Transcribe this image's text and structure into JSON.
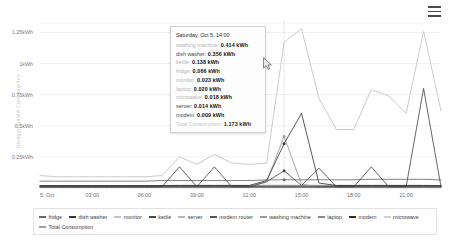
{
  "header": {
    "menu_icon": "hamburger-menu-icon"
  },
  "cursor": {
    "icon": "mouse-pointer-icon",
    "x": 263,
    "y": 57
  },
  "axis": {
    "y_title": "Disaggregated Consumption",
    "y_ticks": [
      "1.25kWh",
      "1kWh",
      "0.75kWh",
      "0.5kWh",
      "0.25kWh"
    ],
    "x_ticks": [
      "5. Oct",
      "03:00",
      "06:00",
      "09:00",
      "12:00",
      "15:00",
      "18:00",
      "21:00"
    ]
  },
  "tooltip": {
    "title": "Saturday, Oct 5, 14:00",
    "rows": [
      {
        "label": "washing machine:",
        "value": "0.414 kWh",
        "dim": true
      },
      {
        "label": "dish washer:",
        "value": "0.356 kWh",
        "dim": false
      },
      {
        "label": "kettle:",
        "value": "0.138 kWh",
        "dim": true
      },
      {
        "label": "fridge:",
        "value": "0.066 kWh",
        "dim": true
      },
      {
        "label": "monitor:",
        "value": "0.023 kWh",
        "dim": true
      },
      {
        "label": "laptop:",
        "value": "0.020 kWh",
        "dim": true
      },
      {
        "label": "microwave:",
        "value": "0.018 kWh",
        "dim": true
      },
      {
        "label": "server:",
        "value": "0.014 kWh",
        "dim": false
      },
      {
        "label": "modem:",
        "value": "0.009 kWh",
        "dim": false
      }
    ],
    "total": {
      "label": "Total Consumption:",
      "value": "1.173 kWh"
    }
  },
  "legend": {
    "items": [
      {
        "label": "fridge",
        "color": "#6b6b6b"
      },
      {
        "label": "dish washer",
        "color": "#3a3a3a"
      },
      {
        "label": "monitor",
        "color": "#c2c2c2"
      },
      {
        "label": "kettle",
        "color": "#4a4a4a"
      },
      {
        "label": "server",
        "color": "#b8b8b8"
      },
      {
        "label": "modem router",
        "color": "#555555"
      },
      {
        "label": "washing machine",
        "color": "#9a9a9a"
      },
      {
        "label": "laptop",
        "color": "#8a8a8a"
      },
      {
        "label": "modem",
        "color": "#2f2f2f"
      },
      {
        "label": "microwave",
        "color": "#cfcfcf"
      },
      {
        "label": "Total Consumption",
        "color": "#9f9f9f"
      }
    ]
  },
  "chart_data": {
    "type": "line",
    "title": "",
    "xlabel": "",
    "ylabel": "Disaggregated Consumption",
    "ylim": [
      0,
      1.35
    ],
    "grid": true,
    "legend_position": "bottom",
    "x": [
      "00:00",
      "01:00",
      "02:00",
      "03:00",
      "04:00",
      "05:00",
      "06:00",
      "07:00",
      "08:00",
      "09:00",
      "10:00",
      "11:00",
      "12:00",
      "13:00",
      "14:00",
      "15:00",
      "16:00",
      "17:00",
      "18:00",
      "19:00",
      "20:00",
      "21:00",
      "22:00",
      "23:00"
    ],
    "series": [
      {
        "name": "Total Consumption",
        "color": "#cccccc",
        "values": [
          0.1,
          0.09,
          0.09,
          0.09,
          0.09,
          0.09,
          0.09,
          0.1,
          0.25,
          0.19,
          0.27,
          0.2,
          0.19,
          0.2,
          1.17,
          1.28,
          0.72,
          0.47,
          0.47,
          0.79,
          0.74,
          0.6,
          1.26,
          0.62
        ]
      },
      {
        "name": "dish washer",
        "color": "#3a3a3a",
        "values": [
          0.02,
          0.02,
          0.02,
          0.02,
          0.02,
          0.02,
          0.02,
          0.02,
          0.02,
          0.02,
          0.02,
          0.02,
          0.02,
          0.06,
          0.356,
          0.6,
          0.04,
          0.02,
          0.02,
          0.02,
          0.02,
          0.02,
          0.02,
          0.02
        ]
      },
      {
        "name": "washing machine",
        "color": "#9a9a9a",
        "values": [
          0.01,
          0.01,
          0.01,
          0.01,
          0.01,
          0.01,
          0.01,
          0.01,
          0.01,
          0.01,
          0.01,
          0.01,
          0.01,
          0.05,
          0.414,
          0.03,
          0.01,
          0.01,
          0.01,
          0.01,
          0.01,
          0.01,
          0.01,
          0.01
        ]
      },
      {
        "name": "kettle",
        "color": "#4a4a4a",
        "values": [
          0.01,
          0.01,
          0.01,
          0.01,
          0.01,
          0.01,
          0.01,
          0.01,
          0.17,
          0.01,
          0.17,
          0.01,
          0.01,
          0.05,
          0.138,
          0.02,
          0.16,
          0.01,
          0.01,
          0.17,
          0.01,
          0.01,
          0.8,
          0.01
        ]
      },
      {
        "name": "fridge",
        "color": "#6b6b6b",
        "values": [
          0.055,
          0.055,
          0.055,
          0.055,
          0.055,
          0.055,
          0.055,
          0.06,
          0.06,
          0.06,
          0.06,
          0.06,
          0.06,
          0.065,
          0.066,
          0.066,
          0.066,
          0.066,
          0.066,
          0.07,
          0.07,
          0.07,
          0.07,
          0.065
        ]
      },
      {
        "name": "monitor",
        "color": "#c2c2c2",
        "values": [
          0.02,
          0.02,
          0.02,
          0.02,
          0.02,
          0.02,
          0.02,
          0.02,
          0.023,
          0.023,
          0.023,
          0.023,
          0.023,
          0.023,
          0.023,
          0.023,
          0.023,
          0.023,
          0.023,
          0.023,
          0.023,
          0.023,
          0.023,
          0.02
        ]
      },
      {
        "name": "laptop",
        "color": "#8a8a8a",
        "values": [
          0.018,
          0.018,
          0.018,
          0.018,
          0.018,
          0.018,
          0.018,
          0.02,
          0.02,
          0.02,
          0.02,
          0.02,
          0.02,
          0.02,
          0.02,
          0.02,
          0.02,
          0.02,
          0.02,
          0.02,
          0.02,
          0.02,
          0.02,
          0.018
        ]
      },
      {
        "name": "microwave",
        "color": "#cfcfcf",
        "values": [
          0.015,
          0.015,
          0.015,
          0.015,
          0.015,
          0.015,
          0.015,
          0.015,
          0.018,
          0.018,
          0.018,
          0.018,
          0.018,
          0.018,
          0.018,
          0.018,
          0.018,
          0.018,
          0.018,
          0.018,
          0.018,
          0.018,
          0.018,
          0.015
        ]
      },
      {
        "name": "server",
        "color": "#b8b8b8",
        "values": [
          0.014,
          0.014,
          0.014,
          0.014,
          0.014,
          0.014,
          0.014,
          0.014,
          0.014,
          0.014,
          0.014,
          0.014,
          0.014,
          0.014,
          0.014,
          0.014,
          0.014,
          0.014,
          0.014,
          0.014,
          0.014,
          0.014,
          0.014,
          0.014
        ]
      },
      {
        "name": "modem",
        "color": "#2f2f2f",
        "values": [
          0.009,
          0.009,
          0.009,
          0.009,
          0.009,
          0.009,
          0.009,
          0.009,
          0.009,
          0.009,
          0.009,
          0.009,
          0.009,
          0.009,
          0.009,
          0.009,
          0.009,
          0.009,
          0.009,
          0.009,
          0.009,
          0.009,
          0.009,
          0.009
        ]
      },
      {
        "name": "modem router",
        "color": "#555555",
        "values": [
          0.008,
          0.008,
          0.008,
          0.008,
          0.008,
          0.008,
          0.008,
          0.008,
          0.008,
          0.008,
          0.008,
          0.008,
          0.008,
          0.008,
          0.008,
          0.008,
          0.008,
          0.008,
          0.008,
          0.008,
          0.008,
          0.008,
          0.008,
          0.008
        ]
      }
    ]
  }
}
